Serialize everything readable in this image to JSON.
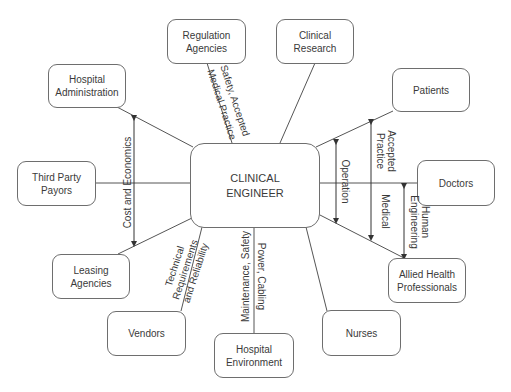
{
  "center": {
    "label": "CLINICAL\nENGINEER"
  },
  "nodes": {
    "regulation": "Regulation\nAgencies",
    "research": "Clinical\nResearch",
    "hospital_admin": "Hospital\nAdministration",
    "patients": "Patients",
    "third_party": "Third Party\nPayors",
    "doctors": "Doctors",
    "leasing": "Leasing\nAgencies",
    "allied": "Allied Health\nProfessionals",
    "vendors": "Vendors",
    "nurses": "Nurses",
    "environment": "Hospital\nEnvironment"
  },
  "edge_labels": {
    "safety_accepted": "Safety,  Accepted",
    "medical_practice": "Medical Practice",
    "cost_economics": "Cost and  Economics",
    "technical": "Technical\nRequirements\nand Reliability",
    "maintenance": "Maintenance, Safety",
    "power": "Power, Cabling",
    "operation": "Operation",
    "accepted_practice": "Accepted\nPractice",
    "medical": "Medical",
    "human_engineering": "Human\nEngineering"
  },
  "colors": {
    "line": "#555555",
    "border": "#6e6e6e",
    "text": "#3a3a3a"
  }
}
